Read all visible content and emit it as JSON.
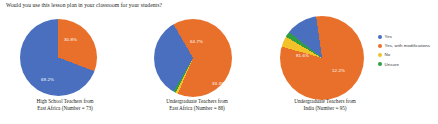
{
  "title": "Would you use this lesson plan in your classroom for your students?",
  "colors": {
    "yes": "#4a6fbf",
    "yes_with_modifications": "#e8702a",
    "no": "#f3c12a",
    "unsure": "#2f9e41",
    "background": "#ffffff",
    "text": "#231f20",
    "label_text": "#ffffff"
  },
  "legend": {
    "position": "right",
    "items": [
      {
        "label": "Yes",
        "color": "#4a6fbf"
      },
      {
        "label": "Yes, with modifications",
        "color": "#e8702a"
      },
      {
        "label": "No",
        "color": "#f3c12a"
      },
      {
        "label": "Unsure",
        "color": "#2f9e41"
      }
    ]
  },
  "charts": [
    {
      "caption_line1": "High School Teachers from",
      "caption_line2": "East Africa (Number = 73)",
      "labels": [
        {
          "text": "30.8%",
          "x": 44,
          "y": 18
        },
        {
          "text": "69.2%",
          "x": 21,
          "y": 58
        }
      ]
    },
    {
      "caption_line1": "Undergraduate Teachers from",
      "caption_line2": "East Africa (Number = 88)",
      "labels": [
        {
          "text": "64.7%",
          "x": 36,
          "y": 20
        },
        {
          "text": "33.3%",
          "x": 58,
          "y": 62
        }
      ]
    },
    {
      "caption_line1": "Undergraduate Teachers from",
      "caption_line2": "India (Number = 95)",
      "labels": [
        {
          "text": "81.6%",
          "x": 16,
          "y": 37
        },
        {
          "text": "12.2%",
          "x": 52,
          "y": 52
        }
      ]
    }
  ],
  "chart_data": [
    {
      "type": "pie",
      "title": "High School Teachers from East Africa (Number = 73)",
      "categories": [
        "Yes",
        "Yes, with modifications",
        "No",
        "Unsure"
      ],
      "values": [
        69.2,
        30.8,
        0,
        0
      ],
      "unit": "%",
      "n": 73
    },
    {
      "type": "pie",
      "title": "Undergraduate Teachers from East Africa (Number = 88)",
      "categories": [
        "Yes",
        "Yes, with modifications",
        "No",
        "Unsure"
      ],
      "values": [
        33.3,
        64.7,
        1.0,
        1.0
      ],
      "unit": "%",
      "n": 88
    },
    {
      "type": "pie",
      "title": "Undergraduate Teachers from India (Number = 95)",
      "categories": [
        "Yes",
        "Yes, with modifications",
        "No",
        "Unsure"
      ],
      "values": [
        12.2,
        81.6,
        4.1,
        2.1
      ],
      "unit": "%",
      "n": 95
    }
  ]
}
